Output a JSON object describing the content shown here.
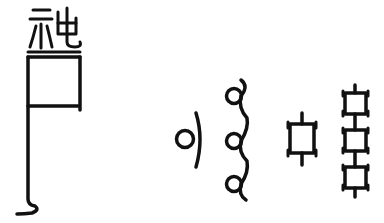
{
  "diagram": {
    "ink_color": "#111111",
    "background": "#ffffff",
    "figures": [
      {
        "id": "full-character",
        "label": "seal-script character with box and long tail"
      },
      {
        "id": "single-loop",
        "label": "single loop component"
      },
      {
        "id": "triple-loop",
        "label": "stacked three-loop component"
      },
      {
        "id": "single-box",
        "label": "single box component with stems"
      },
      {
        "id": "triple-box",
        "label": "stacked three-box component"
      }
    ]
  }
}
